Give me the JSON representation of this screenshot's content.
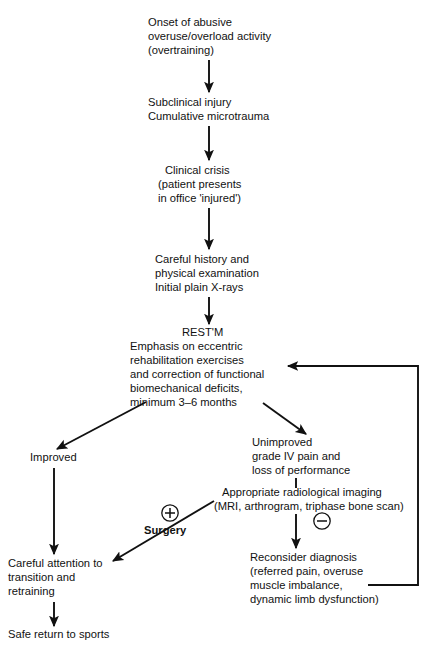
{
  "diagram": {
    "background_color": "#ffffff",
    "ink_color": "#111111"
  },
  "nodes": [
    {
      "id": "onset",
      "name": "node-onset-of-abusive-activity",
      "lines": [
        "Onset of abusive",
        "overuse/overload activity",
        "(overtraining)"
      ],
      "align": "left"
    },
    {
      "id": "subclinical",
      "name": "node-subclinical-injury",
      "lines": [
        "Subclinical injury",
        "Cumulative microtrauma"
      ],
      "align": "left"
    },
    {
      "id": "crisis",
      "name": "node-clinical-crisis",
      "lines": [
        "Clinical crisis",
        "(patient presents",
        "in office 'injured')"
      ],
      "align": "left"
    },
    {
      "id": "history",
      "name": "node-careful-history",
      "lines": [
        "Careful history and",
        "physical examination",
        "Initial plain X-rays"
      ],
      "align": "left"
    },
    {
      "id": "rest",
      "name": "node-rest-protocol",
      "heading": "REST'M",
      "lines": [
        "Emphasis on eccentric",
        "rehabilitation exercises",
        "and correction of functional",
        "biomechanical deficits,",
        "minimum 3–6 months"
      ],
      "align": "left"
    },
    {
      "id": "improved",
      "name": "node-improved",
      "lines": [
        "Improved"
      ],
      "align": "left"
    },
    {
      "id": "unimproved",
      "name": "node-unimproved",
      "lines": [
        "Unimproved",
        "grade IV pain and",
        "loss of performance"
      ],
      "align": "left"
    },
    {
      "id": "imaging",
      "name": "node-radiological-imaging",
      "lines": [
        "Appropriate radiological imaging",
        "(MRI, arthrogram, triphase bone scan)"
      ],
      "align": "left"
    },
    {
      "id": "reconsider",
      "name": "node-reconsider-diagnosis",
      "lines": [
        "Reconsider diagnosis",
        "(referred pain, overuse",
        "muscle imbalance,",
        "dynamic limb dysfunction)"
      ],
      "align": "left"
    },
    {
      "id": "transition",
      "name": "node-careful-attention-transition",
      "lines": [
        "Careful attention to",
        "transition and",
        "retraining"
      ],
      "align": "left"
    },
    {
      "id": "safe-return",
      "name": "node-safe-return-to-sports",
      "lines": [
        "Safe return to sports"
      ],
      "align": "left"
    }
  ],
  "annotations": [
    {
      "id": "surgery",
      "name": "annotation-surgery",
      "label": "Surgery",
      "sign": "+",
      "sign_name": "plus-circle-icon"
    },
    {
      "id": "negative",
      "name": "annotation-negative-finding",
      "label": "",
      "sign": "−",
      "sign_name": "minus-circle-icon"
    }
  ],
  "edges": [
    {
      "name": "edge-onset-to-subclinical",
      "kind": "arrow-down"
    },
    {
      "name": "edge-subclinical-to-crisis",
      "kind": "arrow-down"
    },
    {
      "name": "edge-crisis-to-history",
      "kind": "arrow-down"
    },
    {
      "name": "edge-history-to-rest",
      "kind": "arrow-down"
    },
    {
      "name": "edge-rest-to-improved",
      "kind": "arrow-diagonal-left"
    },
    {
      "name": "edge-rest-to-unimproved",
      "kind": "arrow-diagonal-right"
    },
    {
      "name": "edge-improved-to-transition",
      "kind": "arrow-down"
    },
    {
      "name": "edge-unimproved-to-imaging",
      "kind": "line-down"
    },
    {
      "name": "edge-imaging-to-reconsider",
      "kind": "arrow-down"
    },
    {
      "name": "edge-imaging-to-transition-surgery",
      "kind": "arrow-diagonal-left"
    },
    {
      "name": "edge-transition-to-safe-return",
      "kind": "arrow-down"
    },
    {
      "name": "edge-reconsider-feedback-to-rest",
      "kind": "feedback-loop"
    }
  ]
}
